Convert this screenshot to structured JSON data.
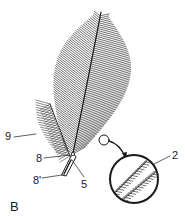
{
  "figure": {
    "panel_letter": "B",
    "labels": [
      {
        "id": "9",
        "text": "9",
        "x": 5,
        "y": 131
      },
      {
        "id": "8",
        "text": "8",
        "x": 36,
        "y": 153
      },
      {
        "id": "8prime",
        "text": "8'",
        "x": 33,
        "y": 175
      },
      {
        "id": "5",
        "text": "5",
        "x": 81,
        "y": 179
      },
      {
        "id": "2",
        "text": "2",
        "x": 172,
        "y": 150
      }
    ],
    "magnifier": {
      "small_circle": {
        "cx": 104,
        "cy": 140,
        "r": 5
      },
      "big_circle": {
        "cx": 134,
        "cy": 179,
        "r": 24
      }
    },
    "colors": {
      "ink": "#1a1a1a",
      "background": "#ffffff"
    }
  }
}
